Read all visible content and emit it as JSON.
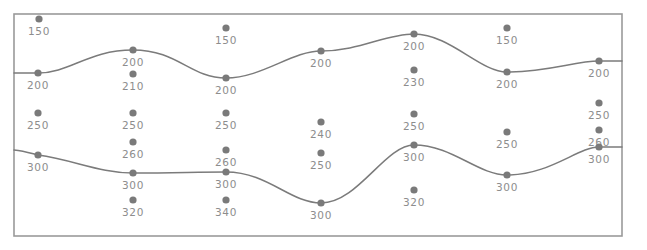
{
  "figure": {
    "title": "",
    "frame": {
      "x": 14,
      "y": 14,
      "width": 608,
      "height": 222,
      "stroke": "#9a9a9a"
    },
    "colors": {
      "dot": "#7a7a7a",
      "label": "#8d8d8d",
      "contour": "#7b7b7b",
      "frame": "#9a9a9a",
      "background": "#ffffff"
    }
  },
  "chart_data": {
    "type": "scatter",
    "title": "",
    "xlabel": "",
    "ylabel": "",
    "grid": false,
    "legend": false,
    "xlim": [
      14,
      622
    ],
    "ylim": [
      14,
      236
    ],
    "value_labels": [
      "150",
      "200",
      "200",
      "210",
      "150",
      "200",
      "200",
      "200",
      "230",
      "150",
      "200",
      "200",
      "250",
      "250",
      "250",
      "240",
      "250",
      "250",
      "260",
      "250",
      "260",
      "260",
      "250",
      "300",
      "300",
      "300",
      "300",
      "300",
      "300",
      "300",
      "320",
      "340",
      "300",
      "320"
    ],
    "points": [
      {
        "label": "150",
        "x": 39,
        "y": 19,
        "on_contour": false
      },
      {
        "label": "200",
        "x": 38,
        "y": 73,
        "on_contour": true
      },
      {
        "label": "200",
        "x": 133,
        "y": 50,
        "on_contour": true
      },
      {
        "label": "210",
        "x": 133,
        "y": 74,
        "on_contour": false
      },
      {
        "label": "200",
        "x": 226,
        "y": 78,
        "on_contour": true
      },
      {
        "label": "150",
        "x": 226,
        "y": 28,
        "on_contour": false
      },
      {
        "label": "200",
        "x": 321,
        "y": 51,
        "on_contour": true
      },
      {
        "label": "200",
        "x": 414,
        "y": 34,
        "on_contour": true
      },
      {
        "label": "230",
        "x": 414,
        "y": 70,
        "on_contour": false
      },
      {
        "label": "150",
        "x": 507,
        "y": 28,
        "on_contour": false
      },
      {
        "label": "200",
        "x": 507,
        "y": 72,
        "on_contour": true
      },
      {
        "label": "200",
        "x": 599,
        "y": 61,
        "on_contour": true
      },
      {
        "label": "250",
        "x": 38,
        "y": 113,
        "on_contour": false
      },
      {
        "label": "250",
        "x": 133,
        "y": 113,
        "on_contour": false
      },
      {
        "label": "250",
        "x": 226,
        "y": 113,
        "on_contour": false
      },
      {
        "label": "240",
        "x": 321,
        "y": 122,
        "on_contour": false
      },
      {
        "label": "250",
        "x": 414,
        "y": 114,
        "on_contour": false
      },
      {
        "label": "250",
        "x": 507,
        "y": 132,
        "on_contour": false
      },
      {
        "label": "250",
        "x": 599,
        "y": 103,
        "on_contour": false
      },
      {
        "label": "260",
        "x": 133,
        "y": 142,
        "on_contour": false
      },
      {
        "label": "260",
        "x": 226,
        "y": 150,
        "on_contour": false
      },
      {
        "label": "250",
        "x": 321,
        "y": 153,
        "on_contour": false
      },
      {
        "label": "260",
        "x": 599,
        "y": 130,
        "on_contour": false
      },
      {
        "label": "300",
        "x": 38,
        "y": 155,
        "on_contour": true
      },
      {
        "label": "300",
        "x": 133,
        "y": 173,
        "on_contour": true
      },
      {
        "label": "300",
        "x": 226,
        "y": 172,
        "on_contour": true
      },
      {
        "label": "300",
        "x": 321,
        "y": 203,
        "on_contour": true
      },
      {
        "label": "300",
        "x": 414,
        "y": 145,
        "on_contour": true
      },
      {
        "label": "300",
        "x": 507,
        "y": 175,
        "on_contour": true
      },
      {
        "label": "300",
        "x": 599,
        "y": 147,
        "on_contour": true
      },
      {
        "label": "320",
        "x": 133,
        "y": 200,
        "on_contour": false
      },
      {
        "label": "340",
        "x": 226,
        "y": 200,
        "on_contour": false
      },
      {
        "label": "320",
        "x": 414,
        "y": 190,
        "on_contour": false
      }
    ],
    "contours": [
      {
        "name": "contour-200",
        "level": 200,
        "path": "M 14,73 C 24,73 30,73 38,73 C 70,73 88,50 133,50 C 178,50 190,78 226,78 C 262,78 292,51 321,51 C 360,51 385,34 414,34 C 450,34 480,72 507,72 C 548,72 575,61 599,61 L 622,61"
      },
      {
        "name": "contour-300",
        "level": 300,
        "path": "M 14,150 C 24,151 30,153 38,155 C 74,160 100,173 133,173 C 175,173 195,172 226,172 C 268,172 290,203 321,203 C 358,203 385,145 414,145 C 452,145 478,175 507,175 C 550,175 578,147 599,147 L 622,147"
      }
    ]
  }
}
